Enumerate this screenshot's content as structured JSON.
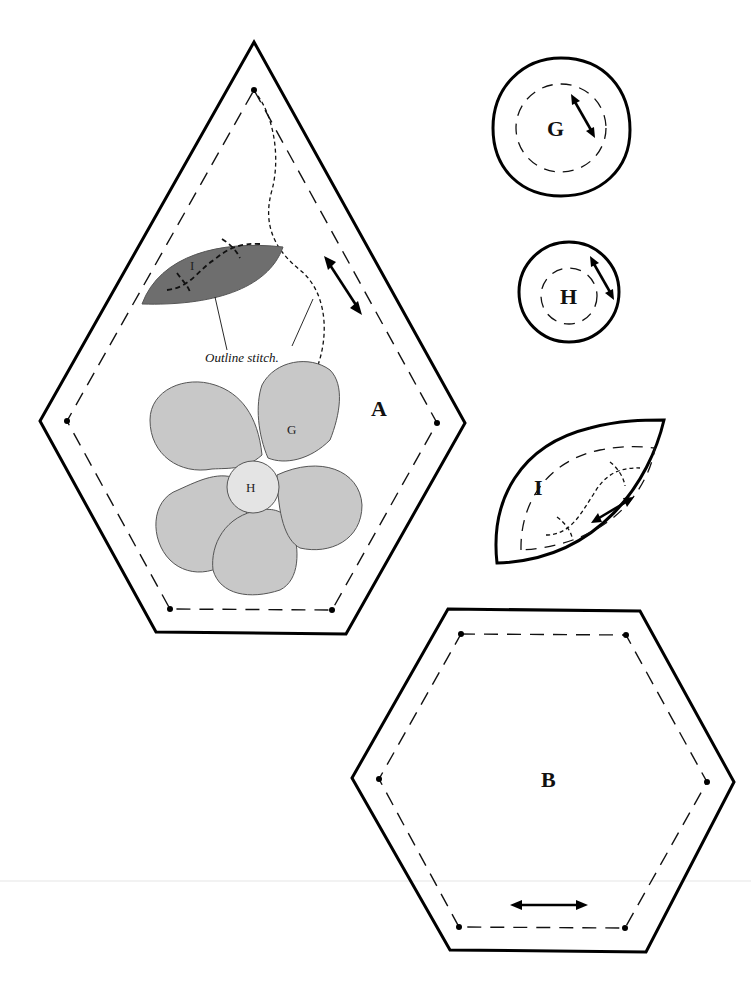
{
  "diagram": {
    "type": "quilt-template-sheet",
    "colors": {
      "background": "#ffffff",
      "cut_line": "#000000",
      "petal_fill": "#c8c8c8",
      "petal_stroke": "#555555",
      "center_fill": "#e4e4e4",
      "leaf_fill": "#6e6e6e"
    },
    "pieces": {
      "A": {
        "label": "A",
        "shape": "elongated-hexagon",
        "grain": "diagonal"
      },
      "B": {
        "label": "B",
        "shape": "hexagon",
        "grain": "horizontal"
      },
      "G": {
        "label": "G",
        "shape": "circle",
        "grain": "diagonal"
      },
      "H": {
        "label": "H",
        "shape": "small-circle",
        "grain": "diagonal"
      },
      "I": {
        "label": "I",
        "shape": "leaf",
        "grain": "diagonal"
      }
    },
    "applique": {
      "leaf_label": "I",
      "petal_label": "G",
      "center_label": "H",
      "stitch_caption": "Outline stitch."
    },
    "legend": {
      "solid_line": "cutting line",
      "dashed_line": "sewing line",
      "double_arrow": "grain direction"
    }
  }
}
